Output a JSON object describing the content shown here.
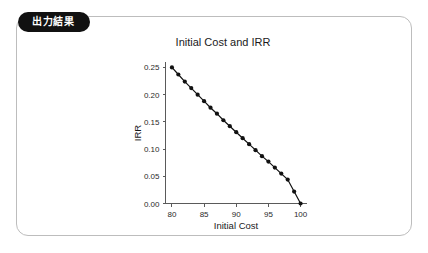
{
  "card": {
    "tab_label": "出力結果"
  },
  "chart_data": {
    "type": "line",
    "title": "Initial Cost and IRR",
    "xlabel": "Initial Cost",
    "ylabel": "IRR",
    "xlim": [
      79,
      101
    ],
    "ylim": [
      0.0,
      0.26
    ],
    "xticks": [
      80,
      85,
      90,
      95,
      100
    ],
    "xtick_labels": [
      "80",
      "85",
      "90",
      "95",
      "100"
    ],
    "yticks": [
      0.0,
      0.05,
      0.1,
      0.15,
      0.2,
      0.25
    ],
    "ytick_labels": [
      "0.00",
      "0.05",
      "0.10",
      "0.15",
      "0.20",
      "0.25"
    ],
    "grid": false,
    "legend": null,
    "marker": "circle",
    "line_color": "#111111",
    "marker_color": "#111111",
    "x": [
      80,
      81,
      82,
      83,
      84,
      85,
      86,
      87,
      88,
      89,
      90,
      91,
      92,
      93,
      94,
      95,
      96,
      97,
      98,
      99,
      100
    ],
    "values": [
      0.25,
      0.237,
      0.224,
      0.212,
      0.2,
      0.188,
      0.176,
      0.165,
      0.153,
      0.142,
      0.131,
      0.12,
      0.109,
      0.098,
      0.087,
      0.077,
      0.066,
      0.055,
      0.044,
      0.022,
      0.0
    ]
  }
}
